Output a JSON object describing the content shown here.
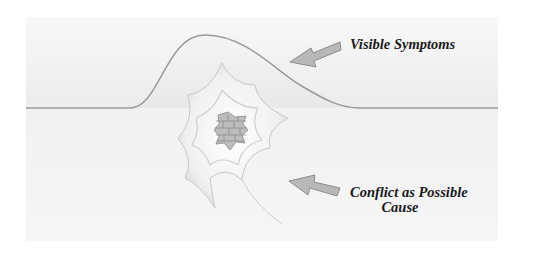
{
  "diagram": {
    "title": "",
    "labels": {
      "top": "Visible Symptoms",
      "bottom_line1": "Conflict as Possible",
      "bottom_line2": "Cause"
    },
    "elements": {
      "surface": "horizon line with bump (visible symptoms)",
      "hole": "cracked web-shaped hole revealing brick wall",
      "arrows": [
        "arrow pointing to bump",
        "arrow pointing to hole"
      ]
    },
    "colors": {
      "line": "#9a9a9a",
      "arrow_fill": "#b8b8b8",
      "brick": "#a9a9a9",
      "text": "#1a1a1a"
    }
  }
}
